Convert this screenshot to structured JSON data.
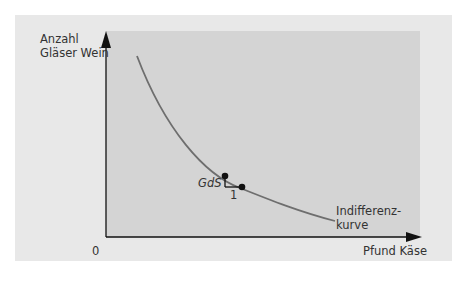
{
  "diagram": {
    "y_axis_label_line1": "Anzahl",
    "y_axis_label_line2": "Gläser Wein",
    "x_axis_label": "Pfund Käse",
    "origin_label": "0",
    "curve_label_line1": "Indifferenz-",
    "curve_label_line2": "kurve",
    "slope_label": "GdS",
    "run_label": "1",
    "colors": {
      "outer_background": "#e8e8e8",
      "plot_background": "#d4d4d4",
      "curve": "#6e6e6e",
      "axes": "#111111"
    }
  }
}
